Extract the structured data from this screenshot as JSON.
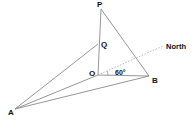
{
  "diagram": {
    "type": "geometry-3d-bearing",
    "points": {
      "P": {
        "label": "P",
        "x": 101,
        "y": 9
      },
      "Q": {
        "label": "Q",
        "x": 98,
        "y": 44
      },
      "O": {
        "label": "O",
        "x": 98,
        "y": 75
      },
      "B": {
        "label": "B",
        "x": 149,
        "y": 76
      },
      "A": {
        "label": "A",
        "x": 15,
        "y": 109
      }
    },
    "north_label": "North",
    "angle_label": "60°",
    "colors": {
      "line": "#8a8a8a",
      "dashed": "#b0b0b0",
      "text": "#111111"
    }
  }
}
